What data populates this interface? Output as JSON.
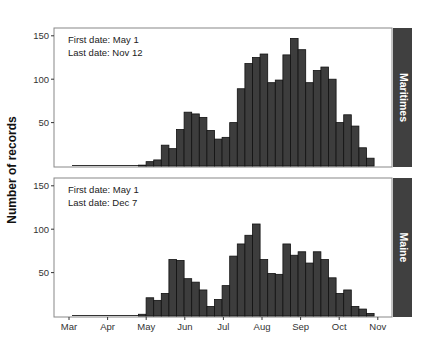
{
  "y_axis_label": "Number of records",
  "x_ticks": [
    "Mar",
    "Apr",
    "May",
    "Jun",
    "Jul",
    "Aug",
    "Sep",
    "Oct",
    "Nov"
  ],
  "y_ticks": [
    50,
    100,
    150
  ],
  "colors": {
    "bar_fill": "#3d3d3d",
    "bar_stroke": "#111111",
    "strip_fill": "#404040",
    "strip_text": "#ffffff",
    "panel_border": "#888888",
    "axis_text": "#333333"
  },
  "panels": [
    {
      "strip_label": "Maritimes",
      "annotation_line1": "First date: May 1",
      "annotation_line2": "Last date: Nov 12"
    },
    {
      "strip_label": "Maine",
      "annotation_line1": "First date: May 1",
      "annotation_line2": "Last date: Dec 7"
    }
  ],
  "chart_data": {
    "type": "bar",
    "subtype": "faceted_histogram",
    "xlabel": "",
    "ylabel": "Number of records",
    "x_tick_labels": [
      "Mar",
      "Apr",
      "May",
      "Jun",
      "Jul",
      "Aug",
      "Sep",
      "Oct",
      "Nov"
    ],
    "ylim": [
      0,
      160
    ],
    "y_ticks": [
      50,
      100,
      150
    ],
    "grid": false,
    "legend": null,
    "facets": [
      "Maritimes",
      "Maine"
    ],
    "bin_start_note": "bins are approx. 6-day intervals starting near early May",
    "series": [
      {
        "name": "Maritimes",
        "annotation": [
          "First date: May 1",
          "Last date: Nov 12"
        ],
        "values": [
          1,
          5,
          7,
          24,
          20,
          42,
          62,
          60,
          56,
          41,
          31,
          33,
          50,
          89,
          118,
          125,
          129,
          96,
          99,
          128,
          147,
          134,
          96,
          110,
          114,
          100,
          50,
          59,
          46,
          21,
          9
        ]
      },
      {
        "name": "Maine",
        "annotation": [
          "First date: May 1",
          "Last date: Dec 7"
        ],
        "values": [
          2,
          21,
          18,
          26,
          65,
          64,
          43,
          39,
          30,
          11,
          19,
          35,
          69,
          83,
          93,
          106,
          65,
          49,
          48,
          83,
          70,
          74,
          61,
          74,
          65,
          44,
          26,
          30,
          11,
          8,
          3
        ]
      }
    ]
  }
}
